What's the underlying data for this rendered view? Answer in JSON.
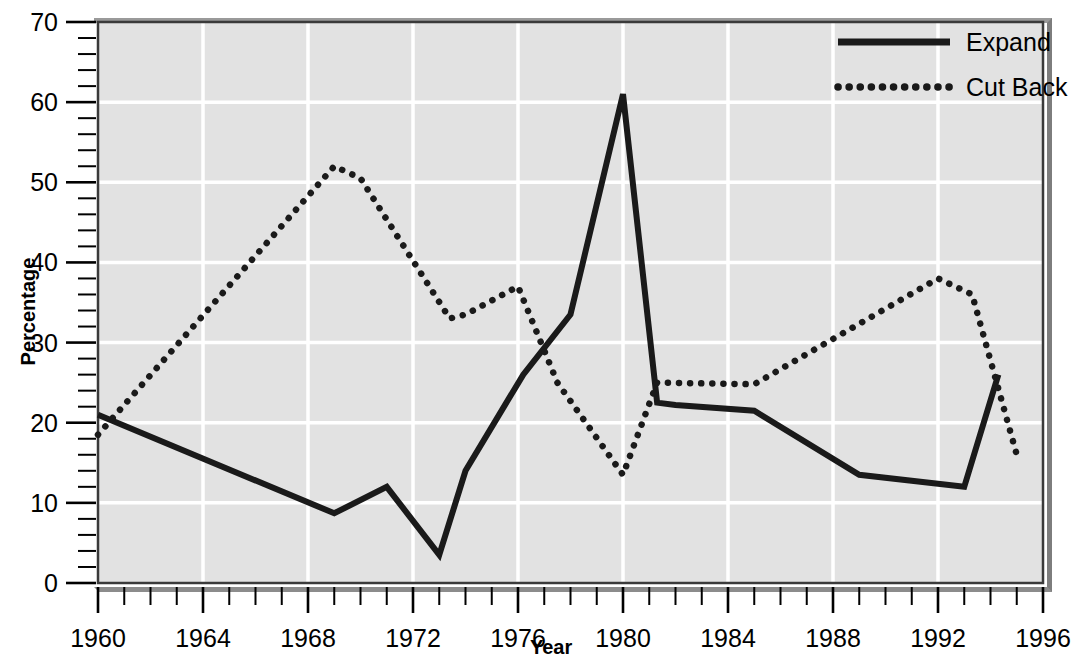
{
  "chart_data": {
    "type": "line",
    "title": "",
    "xlabel": "Year",
    "ylabel": "Percentage",
    "xlim": [
      1960,
      1996
    ],
    "ylim": [
      0,
      70
    ],
    "grid": true,
    "grid_color": "#ffffff",
    "plot_background": "#e2e2e2",
    "legend_position": "top-right",
    "x_ticks_major": [
      1960,
      1964,
      1968,
      1972,
      1976,
      1980,
      1984,
      1988,
      1992,
      1996
    ],
    "x_tick_labels": [
      "1960",
      "1964",
      "1968",
      "1972",
      "1976",
      "1980",
      "1984",
      "1988",
      "1992",
      "1996"
    ],
    "x_tick_minor_step": 1,
    "y_ticks_major": [
      0,
      10,
      20,
      30,
      40,
      50,
      60,
      70
    ],
    "y_tick_labels": [
      "0",
      "10",
      "20",
      "30",
      "40",
      "50",
      "60",
      "70"
    ],
    "y_tick_minor_step": 2,
    "series": [
      {
        "name": "Expand",
        "style": "solid",
        "color": "#1a1a1a",
        "x": [
          1960,
          1969,
          1971,
          1973,
          1974,
          1976.2,
          1978,
          1980,
          1981.3,
          1982,
          1985,
          1989,
          1993,
          1994.3
        ],
        "values": [
          21,
          8.7,
          12,
          3.5,
          14,
          26,
          33.5,
          61,
          22.5,
          22.2,
          21.5,
          13.5,
          12,
          26
        ]
      },
      {
        "name": "Cut Back",
        "style": "dotted",
        "color": "#1a1a1a",
        "x": [
          1960,
          1969,
          1970,
          1973.4,
          1974,
          1976,
          1977.5,
          1980,
          1981.3,
          1985,
          1992,
          1993.3,
          1995
        ],
        "values": [
          18.5,
          52,
          50.5,
          33,
          33.5,
          37,
          25,
          13.5,
          25,
          24.8,
          38,
          36,
          16
        ]
      }
    ]
  },
  "legend": {
    "entries": [
      {
        "label": "Expand",
        "style": "solid"
      },
      {
        "label": "Cut Back",
        "style": "dotted"
      }
    ]
  },
  "axes": {
    "x_title": "Year",
    "y_title": "Percentage"
  }
}
